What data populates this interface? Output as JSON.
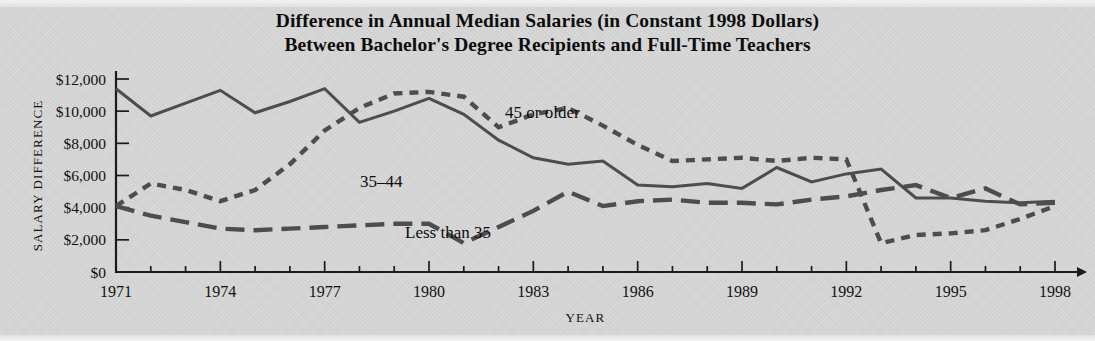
{
  "title": {
    "line1": "Difference in Annual Median Salaries (in Constant 1998 Dollars)",
    "line2": "Between Bachelor's Degree Recipients and Full-Time Teachers"
  },
  "axis": {
    "y_label": "SALARY DIFFERENCE",
    "x_label": "YEAR"
  },
  "annotations": {
    "older": "45 or older",
    "mid": "35–44",
    "young": "Less than 35"
  },
  "colors": {
    "background": "#d6d6d6",
    "ink": "#111111",
    "line": "#4d4d4d",
    "axis": "#1b1b1b"
  },
  "chart_data": {
    "type": "line",
    "title": "Difference in Annual Median Salaries (in Constant 1998 Dollars) Between Bachelor's Degree Recipients and Full-Time Teachers",
    "xlabel": "YEAR",
    "ylabel": "SALARY DIFFERENCE",
    "xlim": [
      1971,
      1998
    ],
    "ylim": [
      0,
      12000
    ],
    "ytick_labels": [
      "$0",
      "$2,000",
      "$4,000",
      "$6,000",
      "$8,000",
      "$10,000",
      "$12,000"
    ],
    "ytick_values": [
      0,
      2000,
      4000,
      6000,
      8000,
      10000,
      12000
    ],
    "xtick_labels": [
      "1971",
      "1974",
      "1977",
      "1980",
      "1983",
      "1986",
      "1989",
      "1992",
      "1995",
      "1998"
    ],
    "xtick_values": [
      1971,
      1974,
      1977,
      1980,
      1983,
      1986,
      1989,
      1992,
      1995,
      1998
    ],
    "minor_xticks_every": 1,
    "grid": false,
    "legend": "inline-annotations",
    "x": [
      1971,
      1972,
      1973,
      1974,
      1975,
      1976,
      1977,
      1978,
      1979,
      1980,
      1981,
      1982,
      1983,
      1984,
      1985,
      1986,
      1987,
      1988,
      1989,
      1990,
      1991,
      1992,
      1993,
      1994,
      1995,
      1996,
      1997,
      1998
    ],
    "series": [
      {
        "name": "35–44",
        "style": "solid",
        "values": [
          11400,
          9700,
          10500,
          11300,
          9900,
          10600,
          11400,
          9300,
          10000,
          10800,
          9800,
          8200,
          7100,
          6700,
          6900,
          5400,
          5300,
          5500,
          5200,
          6500,
          5600,
          6100,
          6400,
          4600,
          4600,
          4400,
          4300,
          4400
        ]
      },
      {
        "name": "45 or older",
        "style": "short-dash",
        "values": [
          4100,
          5500,
          5100,
          4400,
          5100,
          6700,
          8800,
          10200,
          11100,
          11200,
          10900,
          9000,
          9800,
          10200,
          9100,
          7900,
          6900,
          7000,
          7100,
          6900,
          7100,
          7000,
          1800,
          2300,
          2400,
          2600,
          3300,
          4100
        ]
      },
      {
        "name": "Less than 35",
        "style": "long-dash",
        "values": [
          4100,
          3500,
          3100,
          2700,
          2600,
          2700,
          2800,
          2900,
          3000,
          3000,
          1800,
          2800,
          3800,
          5000,
          4100,
          4400,
          4500,
          4300,
          4300,
          4200,
          4500,
          4700,
          5100,
          5400,
          4600,
          5200,
          4200,
          4300
        ]
      }
    ],
    "series_full_note": {
      "35-44_tail": [
        11400,
        9700,
        10500,
        11300,
        9900,
        10600,
        11400,
        9300,
        10000,
        10800,
        9800,
        8200,
        7100,
        6700,
        6900,
        5400,
        5300,
        5500,
        5200,
        6500,
        5600,
        6100,
        6400,
        4600,
        4600,
        4400,
        4300,
        4400
      ],
      "description": "three age-group series compared against full-time teacher salaries, 1971-1998"
    }
  }
}
